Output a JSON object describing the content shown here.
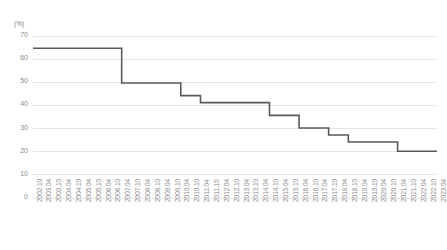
{
  "chart_data": {
    "type": "line",
    "line_style": "step-post",
    "title": "",
    "xlabel": "",
    "ylabel": "",
    "y_unit_label": "(%)",
    "ylim": [
      0,
      70
    ],
    "y_ticks": [
      0,
      10,
      20,
      30,
      40,
      50,
      60,
      70
    ],
    "grid": true,
    "grid_axis": "y",
    "legend": false,
    "series_color": "#595959",
    "grid_color": "#e4e4e4",
    "tick_label_color": "#8d8d8d",
    "categories": [
      "2002.10",
      "2003.04",
      "2003.10",
      "2004.04",
      "2004.10",
      "2005.04",
      "2005.10",
      "2006.04",
      "2006.10",
      "2007.04",
      "2007.10",
      "2008.04",
      "2008.10",
      "2009.04",
      "2009.10",
      "2010.04",
      "2010.10",
      "2011.04",
      "2011.10",
      "2012.04",
      "2012.10",
      "2013.04",
      "2013.10",
      "2014.04",
      "2014.10",
      "2015.04",
      "2015.10",
      "2016.04",
      "2016.10",
      "2017.04",
      "2017.10",
      "2018.04",
      "2018.10",
      "2019.04",
      "2019.10",
      "2020.04",
      "2020.10",
      "2021.04",
      "2021.10",
      "2022.04",
      "2022.10",
      "2023.04"
    ],
    "values": [
      64.5,
      64.5,
      64.5,
      64.5,
      64.5,
      64.5,
      64.5,
      64.5,
      64.5,
      49.5,
      49.5,
      49.5,
      49.5,
      49.5,
      49.5,
      44.0,
      44.0,
      41.0,
      41.0,
      41.0,
      41.0,
      41.0,
      41.0,
      41.0,
      35.5,
      35.5,
      35.5,
      30.0,
      30.0,
      30.0,
      27.0,
      27.0,
      24.0,
      24.0,
      24.0,
      24.0,
      24.0,
      20.0,
      20.0,
      20.0,
      20.0,
      20.0
    ]
  }
}
